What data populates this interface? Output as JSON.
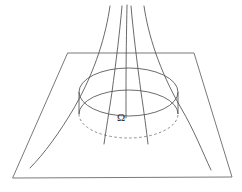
{
  "figure": {
    "background_color": "#ffffff",
    "line_color": "#5a5a5a",
    "label_color": "#2b2b2b",
    "width": 242,
    "height": 192
  },
  "labels": {
    "omega": "Ω",
    "omega_x": 117,
    "omega_y": 112
  },
  "plane": {
    "name": "ground-plane",
    "shape": "trapezoid",
    "corners": [
      {
        "x": 68,
        "y": 53
      },
      {
        "x": 194,
        "y": 53
      },
      {
        "x": 232,
        "y": 177
      },
      {
        "x": 13,
        "y": 178
      }
    ]
  },
  "disk": {
    "name": "omega-disk",
    "center_x": 128.5,
    "center_y": 92,
    "radius_x": 49.5,
    "radius_y": 24,
    "depth": 22,
    "top_ellipse": {
      "cx": 128.5,
      "cy": 92,
      "rx": 49.5,
      "ry": 24
    },
    "bottom_ellipse": {
      "cx": 128.5,
      "cy": 114,
      "rx": 49.5,
      "ry": 24
    },
    "hidden_arc_dash": "2.6 2.4"
  },
  "field_lines": {
    "count": 5,
    "description": "Five curves converging upward through the disk",
    "paths": [
      {
        "id": "field-line-1",
        "top_x": 110,
        "bottom_x": 30,
        "bottom_y": 168
      },
      {
        "id": "field-line-2",
        "top_x": 122,
        "bottom_x": 104,
        "bottom_y": 144
      },
      {
        "id": "field-line-3",
        "top_x": 127,
        "bottom_x": 126,
        "bottom_y": 118
      },
      {
        "id": "field-line-4",
        "top_x": 131,
        "bottom_x": 148,
        "bottom_y": 144
      },
      {
        "id": "field-line-5",
        "top_x": 144,
        "bottom_x": 211,
        "bottom_y": 170
      }
    ]
  }
}
